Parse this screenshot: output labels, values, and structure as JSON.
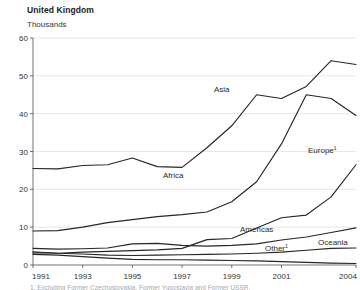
{
  "header": {
    "title": "United Kingdom",
    "units": "Thousands"
  },
  "footnote": {
    "text": "1. Excluding Former Czechoslovakia, Former Yugoslavia and Former USSR."
  },
  "chart_data": {
    "type": "line",
    "title": "United Kingdom",
    "subtitle": "Thousands",
    "xlabel": "",
    "ylabel": "Thousands",
    "xlim": [
      1991,
      2004
    ],
    "ylim": [
      0,
      60
    ],
    "yticks": [
      0,
      10,
      20,
      30,
      40,
      50,
      60
    ],
    "xticks": [
      1991,
      1993,
      1995,
      1997,
      1999,
      2001,
      2004
    ],
    "xtick_labels": [
      "1991",
      "1993",
      "1995",
      "1997",
      "1999",
      "2001",
      "2004"
    ],
    "ytick_labels": [
      "0",
      "10",
      "20",
      "30",
      "40",
      "50",
      "60"
    ],
    "grid": true,
    "legend": "inline-labels",
    "x": [
      1991,
      1992,
      1993,
      1994,
      1995,
      1996,
      1997,
      1998,
      1999,
      2000,
      2001,
      2002,
      2003,
      2004
    ],
    "series": [
      {
        "name": "Asia",
        "label": "Asia",
        "label_sup": "",
        "values": [
          25.5,
          25.4,
          26.3,
          26.5,
          28.3,
          26.0,
          25.8,
          31.0,
          36.8,
          45.0,
          44.0,
          47.2,
          54.0,
          53.0
        ],
        "label_x": 214,
        "label_y": 92
      },
      {
        "name": "Africa",
        "label": "Africa",
        "label_sup": "",
        "values": [
          9.0,
          9.1,
          10.0,
          11.2,
          12.0,
          12.8,
          13.3,
          14.0,
          16.7,
          22.0,
          32.0,
          45.0,
          44.0,
          39.5
        ],
        "label_x": 163,
        "label_y": 178
      },
      {
        "name": "Europe",
        "label": "Europe",
        "label_sup": "1",
        "values": [
          3.2,
          3.1,
          3.4,
          3.6,
          3.8,
          4.0,
          4.4,
          6.7,
          7.0,
          9.8,
          12.5,
          13.2,
          18.0,
          26.5
        ],
        "label_x": 308,
        "label_y": 153
      },
      {
        "name": "Americas",
        "label": "Americas",
        "label_sup": "",
        "values": [
          4.4,
          4.2,
          4.3,
          4.5,
          5.6,
          5.7,
          5.2,
          5.0,
          5.2,
          5.6,
          6.6,
          7.4,
          8.6,
          9.8
        ],
        "label_x": 240,
        "label_y": 232
      },
      {
        "name": "Oceania",
        "label": "Oceania",
        "label_sup": "",
        "values": [
          3.5,
          3.1,
          2.9,
          2.6,
          2.5,
          2.6,
          2.7,
          2.8,
          2.9,
          3.1,
          3.4,
          3.9,
          4.4,
          4.5
        ],
        "label_x": 318,
        "label_y": 245
      },
      {
        "name": "Other",
        "label": "Other",
        "label_sup": "1",
        "values": [
          2.8,
          2.6,
          2.2,
          1.8,
          1.5,
          1.4,
          1.4,
          1.3,
          1.2,
          1.1,
          0.9,
          0.7,
          0.5,
          0.4
        ],
        "label_x": 265,
        "label_y": 251
      }
    ],
    "colors": {
      "line": "#262626",
      "grid": "#dcdcdc",
      "axis": "#4d4d4d",
      "text": "#333333"
    }
  }
}
